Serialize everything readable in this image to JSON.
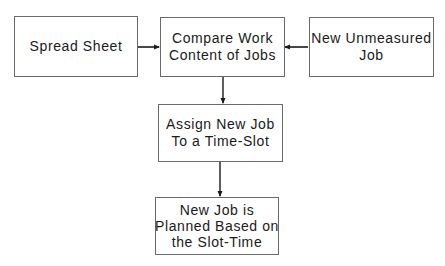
{
  "diagram": {
    "type": "flowchart",
    "nodes": [
      {
        "id": "spread-sheet",
        "lines": [
          "Spread Sheet"
        ]
      },
      {
        "id": "compare-work",
        "lines": [
          "Compare Work",
          "Content of Jobs"
        ]
      },
      {
        "id": "new-unmeasured",
        "lines": [
          "New Unmeasured",
          "Job"
        ]
      },
      {
        "id": "assign-slot",
        "lines": [
          "Assign New Job",
          "To a Time-Slot"
        ]
      },
      {
        "id": "planned",
        "lines": [
          "New Job is",
          "Planned Based on",
          "the Slot-Time"
        ]
      }
    ],
    "edges": [
      {
        "from": "spread-sheet",
        "to": "compare-work"
      },
      {
        "from": "new-unmeasured",
        "to": "compare-work"
      },
      {
        "from": "compare-work",
        "to": "assign-slot"
      },
      {
        "from": "assign-slot",
        "to": "planned"
      }
    ]
  }
}
